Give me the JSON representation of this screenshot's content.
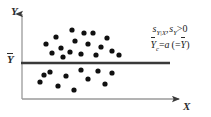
{
  "figure": {
    "background_color": "#ffffff",
    "axis_color": "#8a8a8a",
    "point_color": "#101010",
    "mean_line_color": "#3a3a3a",
    "text_color": "#2b2b2b"
  },
  "axes": {
    "y_label": "Y",
    "x_label": "X",
    "y_mean_tick_label": "Y",
    "y_mean_tick_overbar": true,
    "y_axis_has_arrow": true,
    "x_axis_has_arrow": true
  },
  "annotation": {
    "line1": {
      "sym1": "s",
      "sub1": "Y|X",
      "separator": ",",
      "sym2": "s",
      "sub2": "Y",
      "relation": ">",
      "value": "0"
    },
    "line2": {
      "lhs_sym": "Y",
      "lhs_sub": "c",
      "equals": "=",
      "rhs": "a",
      "paren_open": "(",
      "paren_equals": "=",
      "paren_sym": "Y",
      "paren_close": ")"
    },
    "line1_text": "sY|X, sY > 0",
    "line2_text": "Yc = a ( = Y )"
  },
  "chart_data": {
    "type": "scatter",
    "title": "",
    "xlabel": "X",
    "ylabel": "Y",
    "grid": false,
    "legend": false,
    "xlim": [
      0,
      211
    ],
    "ylim": [
      0,
      117
    ],
    "mean_line": {
      "orientation": "horizontal",
      "y": 63,
      "x_start": 21,
      "x_end": 170,
      "label": "Yc = a (= Y-bar)",
      "width": 2.2
    },
    "axis_geometry": {
      "y_axis": {
        "x": 22,
        "y_top": 11,
        "y_bottom": 99
      },
      "x_axis": {
        "y": 99,
        "x_start": 22,
        "x_end": 184
      }
    },
    "point_radius": 2.6,
    "series": [
      {
        "name": "observations above mean",
        "color": "#101010",
        "points": [
          [
            46,
            44
          ],
          [
            56,
            37
          ],
          [
            61,
            48
          ],
          [
            52,
            53
          ],
          [
            63,
            57
          ],
          [
            72,
            30
          ],
          [
            75,
            41
          ],
          [
            70,
            52
          ],
          [
            81,
            54
          ],
          [
            88,
            44
          ],
          [
            93,
            33
          ],
          [
            96,
            55
          ],
          [
            101,
            47
          ],
          [
            107,
            38
          ],
          [
            112,
            51
          ],
          [
            119,
            55
          ],
          [
            84,
            33
          ]
        ]
      },
      {
        "name": "observations below mean",
        "color": "#101010",
        "points": [
          [
            40,
            82
          ],
          [
            50,
            72
          ],
          [
            58,
            86
          ],
          [
            66,
            76
          ],
          [
            74,
            90
          ],
          [
            81,
            70
          ],
          [
            88,
            79
          ],
          [
            98,
            71
          ],
          [
            105,
            84
          ],
          [
            112,
            73
          ],
          [
            44,
            75
          ]
        ]
      }
    ]
  }
}
